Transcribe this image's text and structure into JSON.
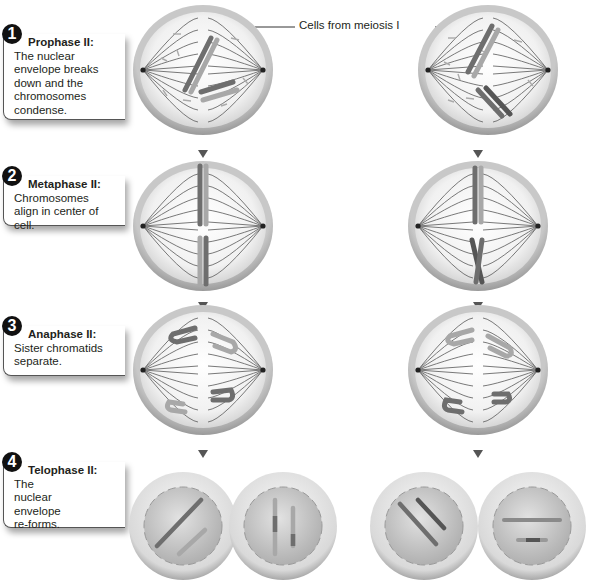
{
  "diagram": {
    "topic": "Meiosis II",
    "cells_label": "Cells from meiosis I",
    "stages": [
      {
        "number": "1",
        "title": "Prophase II:",
        "description": "The nuclear envelope breaks down and the chromosomes condense."
      },
      {
        "number": "2",
        "title": "Metaphase II:",
        "description": "Chromosomes align in center of cell."
      },
      {
        "number": "3",
        "title": "Anaphase II:",
        "description": "Sister chromatids separate."
      },
      {
        "number": "4",
        "title": "Telophase II:",
        "description": "The nuclear envelope re-forms."
      }
    ],
    "columns": [
      "left-lineage",
      "right-lineage"
    ],
    "colors": {
      "cell_membrane": "#b8b8b8",
      "cytoplasm": "#f2f2f2",
      "spindle": "#555555",
      "chromosome_dark": "#6e6e6e",
      "chromosome_light": "#a8a8a8",
      "arrow": "#555555",
      "callout_number_bg": "#111111"
    }
  }
}
